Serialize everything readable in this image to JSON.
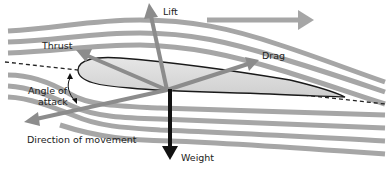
{
  "diagram": {
    "labels": {
      "lift": "Lift",
      "thrust": "Thrust",
      "drag": "Drag",
      "weight": "Weight",
      "angle_of_attack_line1": "Angle of",
      "angle_of_attack_line2": "attack",
      "direction_of_movement": "Direction of movement"
    },
    "colors": {
      "streamline": "#a6a6a6",
      "force_arrow": "#8c8c8c",
      "weight_arrow": "#111111",
      "airfoil_fill": "#dcdcdc",
      "airfoil_outline": "#1a1a1a",
      "airflow_arrow": "#a6a6a6"
    },
    "elements": [
      {
        "id": "airflow-arrow",
        "description": "Airflow direction arrow pointing right"
      },
      {
        "id": "streamlines",
        "count": 11
      },
      {
        "id": "chord-line",
        "style": "dashed"
      },
      {
        "id": "airfoil"
      },
      {
        "id": "lift-vector",
        "direction": "up"
      },
      {
        "id": "thrust-vector",
        "direction": "up-left"
      },
      {
        "id": "drag-vector",
        "direction": "up-right"
      },
      {
        "id": "weight-vector",
        "direction": "down"
      },
      {
        "id": "movement-vector",
        "direction": "down-left"
      },
      {
        "id": "angle-of-attack-arc"
      }
    ]
  }
}
